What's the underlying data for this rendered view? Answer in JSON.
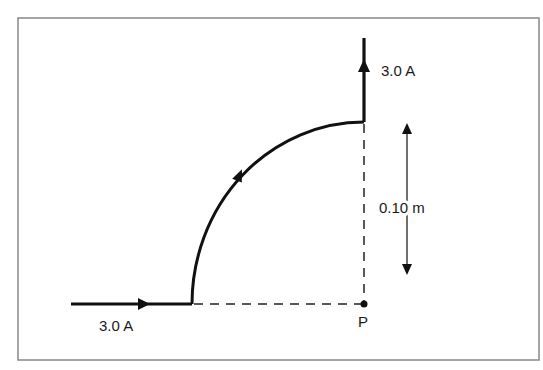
{
  "diagram": {
    "top_current_label": "3.0 A",
    "bottom_current_label": "3.0 A",
    "distance_label": "0.10 m",
    "point_label": "P",
    "colors": {
      "wire": "#111111",
      "frame": "#888888",
      "dashed": "#222222",
      "background": "#ffffff"
    }
  }
}
